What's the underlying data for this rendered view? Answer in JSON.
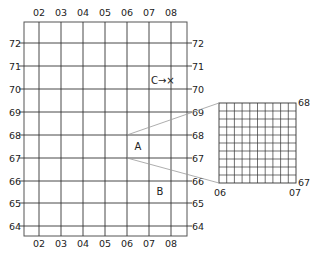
{
  "diagram": {
    "main_grid": {
      "easting_labels": [
        "02",
        "03",
        "04",
        "05",
        "06",
        "07",
        "08"
      ],
      "northing_labels": [
        "72",
        "71",
        "70",
        "69",
        "68",
        "67",
        "66",
        "65",
        "64"
      ],
      "line_color": "#333333",
      "border_color": "#555555"
    },
    "squares": {
      "a": {
        "label": "A",
        "easting": "06",
        "northing": "67"
      },
      "b": {
        "label": "B",
        "easting": "07",
        "northing": "65"
      },
      "c": {
        "label": "C→×",
        "easting": "07",
        "northing": "70"
      }
    },
    "inset": {
      "grid_divisions": 10,
      "corner_labels": {
        "top_right": "68",
        "bottom_right": "67",
        "bottom_left": "06",
        "bottom_right_easting": "07"
      },
      "connector_color": "#999999"
    }
  }
}
